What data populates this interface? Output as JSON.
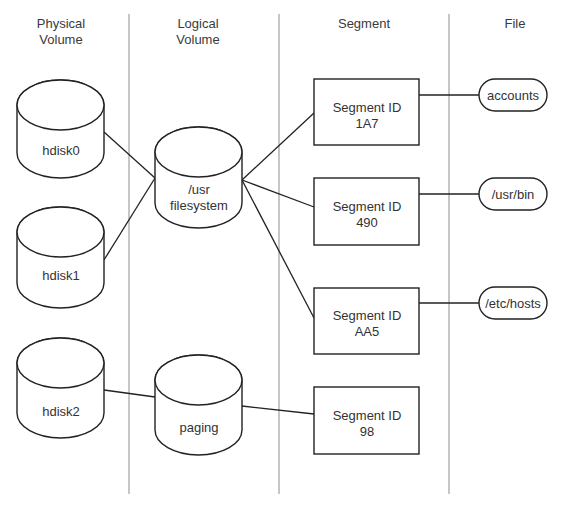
{
  "columns": [
    {
      "id": "physical",
      "line1": "Physical",
      "line2": "Volume"
    },
    {
      "id": "logical",
      "line1": "Logical",
      "line2": "Volume"
    },
    {
      "id": "segment",
      "line1": "Segment",
      "line2": ""
    },
    {
      "id": "file",
      "line1": "File",
      "line2": ""
    }
  ],
  "physical_volumes": [
    {
      "id": "hdisk0",
      "label": "hdisk0"
    },
    {
      "id": "hdisk1",
      "label": "hdisk1"
    },
    {
      "id": "hdisk2",
      "label": "hdisk2"
    }
  ],
  "logical_volumes": [
    {
      "id": "usr",
      "line1": "/usr",
      "line2": "filesystem"
    },
    {
      "id": "paging",
      "line1": "paging",
      "line2": ""
    }
  ],
  "segments": [
    {
      "id": "1A7",
      "line1": "Segment ID",
      "line2": "1A7"
    },
    {
      "id": "490",
      "line1": "Segment ID",
      "line2": "490"
    },
    {
      "id": "AA5",
      "line1": "Segment ID",
      "line2": "AA5"
    },
    {
      "id": "98",
      "line1": "Segment ID",
      "line2": "98"
    }
  ],
  "files": [
    {
      "id": "accounts",
      "label": "accounts"
    },
    {
      "id": "usr-bin",
      "label": "/usr/bin"
    },
    {
      "id": "etc-hosts",
      "label": "/etc/hosts"
    }
  ],
  "connections": [
    {
      "from": "hdisk0",
      "to": "usr"
    },
    {
      "from": "hdisk1",
      "to": "usr"
    },
    {
      "from": "hdisk2",
      "to": "paging"
    },
    {
      "from": "usr",
      "to": "1A7"
    },
    {
      "from": "usr",
      "to": "490"
    },
    {
      "from": "usr",
      "to": "AA5"
    },
    {
      "from": "paging",
      "to": "98"
    },
    {
      "from": "1A7",
      "to": "accounts"
    },
    {
      "from": "490",
      "to": "usr-bin"
    },
    {
      "from": "AA5",
      "to": "etc-hosts"
    }
  ]
}
